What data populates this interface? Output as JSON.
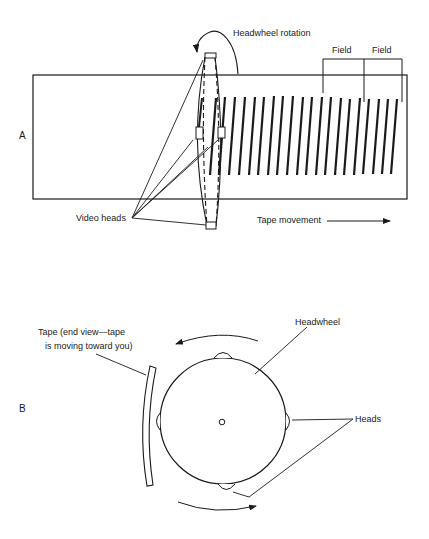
{
  "panel_a": {
    "label": "A",
    "headwheel_rotation_label": "Headwheel rotation",
    "field_labels": [
      "Field",
      "Field"
    ],
    "video_heads_label": "Video heads",
    "tape_movement_label": "Tape movement",
    "track_count": 21
  },
  "panel_b": {
    "label": "B",
    "tape_label_line1": "Tape (end view—tape",
    "tape_label_line2": "is moving toward you)",
    "headwheel_label": "Headwheel",
    "heads_label": "Heads"
  },
  "colors": {
    "ink": "#1a1a1a",
    "background": "#ffffff"
  }
}
